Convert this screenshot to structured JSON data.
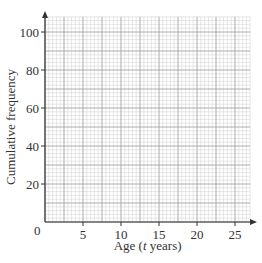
{
  "chart_data": {
    "type": "line",
    "title": "",
    "xlabel": "Age (t years)",
    "xlabel_parts": {
      "prefix": "Age (",
      "italic": "t",
      "suffix": " years)"
    },
    "ylabel": "Cumulative frequency",
    "xlim": [
      0,
      27.5
    ],
    "ylim": [
      0,
      110
    ],
    "x_ticks": [
      0,
      5,
      10,
      15,
      20,
      25
    ],
    "y_ticks": [
      20,
      40,
      60,
      80,
      100
    ],
    "origin_label": "0",
    "grid": true,
    "grid_minor_x": 0.5,
    "grid_minor_y": 2,
    "grid_major_x": 2.5,
    "grid_major_y": 10,
    "series": [],
    "legend": null
  },
  "colors": {
    "axis": "#333333",
    "grid_major": "#9a9a9a",
    "grid_minor": "#cfcfcf"
  }
}
